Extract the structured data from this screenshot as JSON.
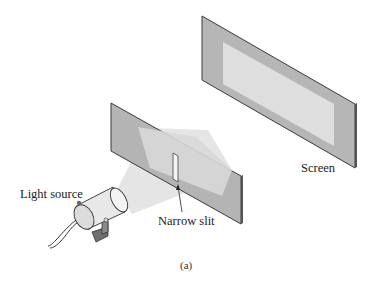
{
  "figure": {
    "caption": "(a)",
    "labels": {
      "screen": "Screen",
      "light_source": "Light source",
      "narrow_slit": "Narrow slit"
    },
    "colors": {
      "plate": "#b4b4b4",
      "plate_edge": "#3a3a3a",
      "illuminated": "#dcdcdc",
      "beam": "#e6e6e6",
      "lamp_body": "#e8e8e8",
      "bracket": "#6e6e6e"
    }
  }
}
